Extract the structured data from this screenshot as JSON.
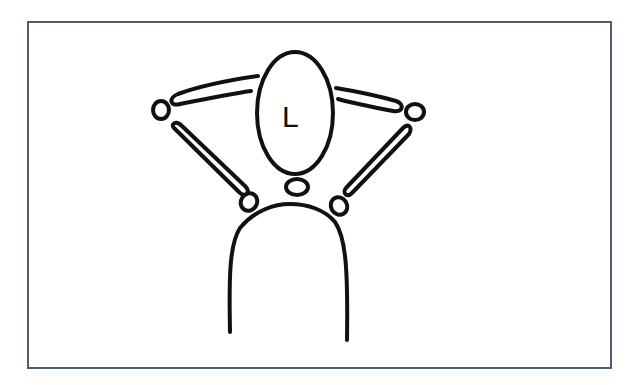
{
  "diagram": {
    "frame_color": "#4d5e70",
    "stroke_color": "#111111",
    "head_label": "L"
  }
}
